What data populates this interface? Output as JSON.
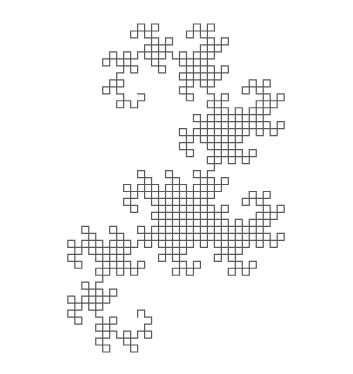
{
  "figure": {
    "kind": "fractal-curve",
    "background": "#ffffff",
    "stroke_color": "#5a5a5a",
    "stroke_width": 1.2,
    "bbox": {
      "x0": 18,
      "y0": 24,
      "x1": 334,
      "y1": 352
    },
    "lsystem": {
      "axiom": "FX",
      "rules": {
        "X": "X+YF+",
        "Y": "-FX-Y"
      },
      "angle_deg": 90,
      "iterations": 10,
      "start_heading_deg": 0
    }
  }
}
